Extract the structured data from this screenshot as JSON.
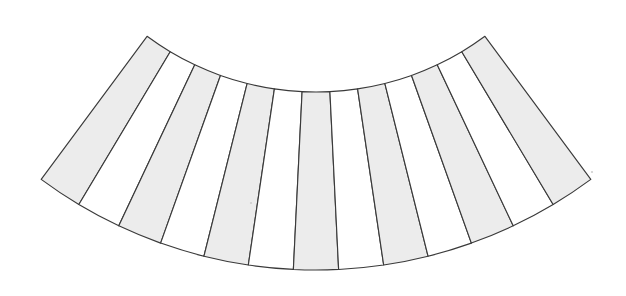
{
  "figure": {
    "background_color": "#ffffff",
    "stroke_color": "#3a3a3a",
    "shaded_fill": "#ececec",
    "plain_fill": "#ffffff",
    "speck_color": "#cfcfcf"
  },
  "chart_data": {
    "type": "pie",
    "geometry": {
      "center_x": 316,
      "center_y": -192,
      "inner_radius": 284,
      "outer_radius": 462,
      "start_angle_deg": -36.5,
      "end_angle_deg": 36.5,
      "segment_count": 13,
      "angular_span_deg": 73.0
    },
    "categories": [
      "seg-1",
      "seg-2",
      "seg-3",
      "seg-4",
      "seg-5",
      "seg-6",
      "seg-7",
      "seg-8",
      "seg-9",
      "seg-10",
      "seg-11",
      "seg-12",
      "seg-13"
    ],
    "values": [
      5.615,
      5.615,
      5.615,
      5.615,
      5.615,
      5.615,
      5.615,
      5.615,
      5.615,
      5.615,
      5.615,
      5.615,
      5.615
    ],
    "fills": [
      "shaded",
      "plain",
      "shaded",
      "plain",
      "shaded",
      "plain",
      "shaded",
      "plain",
      "shaded",
      "plain",
      "shaded",
      "plain",
      "shaded"
    ],
    "legend": [],
    "xlabel": "",
    "ylabel": "",
    "grid": false
  },
  "segments": [
    {
      "index": 1,
      "name": "segment-1",
      "fill": "shaded"
    },
    {
      "index": 2,
      "name": "segment-2",
      "fill": "plain"
    },
    {
      "index": 3,
      "name": "segment-3",
      "fill": "shaded"
    },
    {
      "index": 4,
      "name": "segment-4",
      "fill": "plain"
    },
    {
      "index": 5,
      "name": "segment-5",
      "fill": "shaded"
    },
    {
      "index": 6,
      "name": "segment-6",
      "fill": "plain"
    },
    {
      "index": 7,
      "name": "segment-7",
      "fill": "shaded"
    },
    {
      "index": 8,
      "name": "segment-8",
      "fill": "plain"
    },
    {
      "index": 9,
      "name": "segment-9",
      "fill": "shaded"
    },
    {
      "index": 10,
      "name": "segment-10",
      "fill": "plain"
    },
    {
      "index": 11,
      "name": "segment-11",
      "fill": "shaded"
    },
    {
      "index": 12,
      "name": "segment-12",
      "fill": "plain"
    },
    {
      "index": 13,
      "name": "segment-13",
      "fill": "shaded"
    }
  ],
  "specks": [
    {
      "x": 251,
      "y": 203,
      "r": 1.1
    },
    {
      "x": 592,
      "y": 172,
      "r": 1.1
    }
  ]
}
